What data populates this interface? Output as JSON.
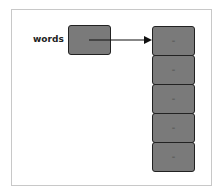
{
  "variable": {
    "label": "words"
  },
  "array": {
    "cells": [
      "–",
      "–",
      "–",
      "–",
      "–"
    ]
  },
  "colors": {
    "box_fill": "#7a7a7a",
    "border": "#222222",
    "frame": "#c8c8c8"
  }
}
